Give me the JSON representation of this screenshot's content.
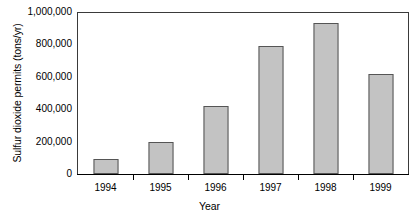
{
  "chart_data": {
    "type": "bar",
    "title": "",
    "subtitle": "",
    "xlabel": "Year",
    "ylabel": "Sulfur dioxide permits (tons/yr)",
    "categories": [
      "1994",
      "1995",
      "1996",
      "1997",
      "1998",
      "1999"
    ],
    "values": [
      95000,
      198000,
      420000,
      790000,
      935000,
      618000
    ],
    "series": [
      {
        "name": "Sulfur dioxide permits",
        "values": [
          95000,
          198000,
          420000,
          790000,
          935000,
          618000
        ]
      }
    ],
    "ylim": [
      0,
      1000000
    ],
    "ytick_values": [
      0,
      200000,
      400000,
      600000,
      800000,
      1000000
    ],
    "ytick_labels": [
      "0",
      "200,000",
      "400,000",
      "600,000",
      "800,000",
      "1,000,000"
    ],
    "grid": false,
    "legend": false,
    "legend_position": "none",
    "bar_fill_color": "#c3c3c3",
    "bar_border_color": "#555555",
    "axis_color": "#000000",
    "frame_color": "#3a3a3a",
    "background_color": "#ffffff"
  }
}
